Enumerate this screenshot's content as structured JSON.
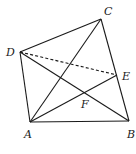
{
  "diagram": {
    "type": "geometry",
    "points": {
      "A": {
        "x": 30,
        "y": 122,
        "label": "A",
        "lx": 24,
        "ly": 138
      },
      "B": {
        "x": 129,
        "y": 121,
        "label": "B",
        "lx": 127,
        "ly": 138
      },
      "C": {
        "x": 101,
        "y": 19,
        "label": "C",
        "lx": 104,
        "ly": 15
      },
      "D": {
        "x": 20,
        "y": 52,
        "label": "D",
        "lx": 6,
        "ly": 56
      },
      "E": {
        "x": 117,
        "y": 75,
        "label": "E",
        "lx": 122,
        "ly": 80
      },
      "F": {
        "x": 84,
        "y": 92,
        "label": "F",
        "lx": 81,
        "ly": 108
      }
    },
    "segments": [
      {
        "from": "A",
        "to": "B",
        "style": "solid"
      },
      {
        "from": "B",
        "to": "C",
        "style": "solid"
      },
      {
        "from": "C",
        "to": "D",
        "style": "solid"
      },
      {
        "from": "D",
        "to": "A",
        "style": "solid"
      },
      {
        "from": "A",
        "to": "C",
        "style": "solid"
      },
      {
        "from": "B",
        "to": "D",
        "style": "solid"
      },
      {
        "from": "A",
        "to": "E",
        "style": "solid"
      },
      {
        "from": "D",
        "to": "E",
        "style": "dashed"
      }
    ],
    "line_color": "#1a1a1a"
  }
}
